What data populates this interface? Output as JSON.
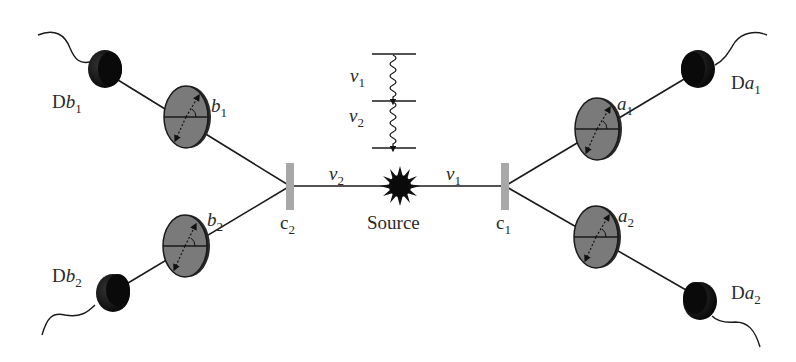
{
  "diagram": {
    "source": {
      "label": "Source"
    },
    "photons": {
      "left": {
        "symbol": "ν",
        "sub": "2"
      },
      "right": {
        "symbol": "ν",
        "sub": "1"
      }
    },
    "energy_levels": {
      "upper_transition": {
        "symbol": "ν",
        "sub": "1"
      },
      "lower_transition": {
        "symbol": "ν",
        "sub": "2"
      }
    },
    "beam_splitters": {
      "left": {
        "letter": "c",
        "sub": "2"
      },
      "right": {
        "letter": "c",
        "sub": "1"
      }
    },
    "polarizers": {
      "b1": {
        "letter": "b",
        "sub": "1"
      },
      "b2": {
        "letter": "b",
        "sub": "2"
      },
      "a1": {
        "letter": "a",
        "sub": "1"
      },
      "a2": {
        "letter": "a",
        "sub": "2"
      }
    },
    "detectors": {
      "Db1": {
        "prefix": "D",
        "letter": "b",
        "sub": "1"
      },
      "Db2": {
        "prefix": "D",
        "letter": "b",
        "sub": "2"
      },
      "Da1": {
        "prefix": "D",
        "letter": "a",
        "sub": "1"
      },
      "Da2": {
        "prefix": "D",
        "letter": "a",
        "sub": "2"
      }
    },
    "colors": {
      "line": "#1a1a1a",
      "polarizer_fill": "#7a7a7a",
      "detector_fill": "#111111",
      "beam_splitter": "#a8a8a8"
    }
  }
}
